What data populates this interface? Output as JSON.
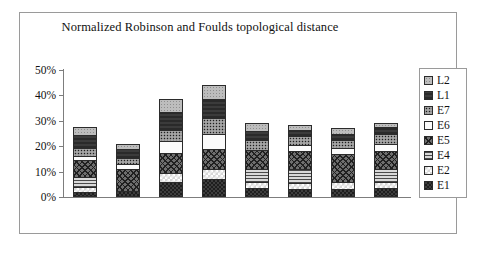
{
  "chart_data": {
    "type": "bar",
    "subtype": "stacked-column",
    "title": "Normalized Robinson and Foulds topological distance",
    "xlabel": "",
    "ylabel": "",
    "ylim": [
      0,
      50
    ],
    "ytick_labels": [
      "0%",
      "10%",
      "20%",
      "30%",
      "40%",
      "50%"
    ],
    "ytick_values": [
      0,
      10,
      20,
      30,
      40,
      50
    ],
    "grid": false,
    "legend_position": "right",
    "legend_order_top_to_bottom": [
      "L2",
      "L1",
      "E7",
      "E6",
      "E5",
      "E4",
      "E2",
      "E1"
    ],
    "stack_order_bottom_to_top": [
      "E1",
      "E2",
      "E4",
      "E5",
      "E6",
      "E7",
      "L1",
      "L2"
    ],
    "categories": [
      "E1",
      "E2",
      "E4",
      "E5",
      "E6",
      "E7",
      "L1",
      "L2"
    ],
    "series": [
      {
        "name": "E1",
        "pattern": "E1",
        "values": [
          2.0,
          2.5,
          6.0,
          7.0,
          3.5,
          3.0,
          3.0,
          3.5
        ]
      },
      {
        "name": "E2",
        "pattern": "E2",
        "values": [
          2.0,
          0.0,
          3.5,
          4.0,
          2.5,
          2.5,
          3.0,
          2.5
        ]
      },
      {
        "name": "E4",
        "pattern": "E4",
        "values": [
          4.0,
          0.0,
          0.0,
          0.0,
          5.0,
          5.5,
          0.0,
          5.0
        ]
      },
      {
        "name": "E5",
        "pattern": "E5",
        "values": [
          6.5,
          8.5,
          8.0,
          8.0,
          7.5,
          7.0,
          11.0,
          7.0
        ]
      },
      {
        "name": "E6",
        "pattern": "E6",
        "values": [
          1.5,
          2.0,
          4.5,
          6.0,
          0.0,
          2.5,
          2.5,
          3.0
        ]
      },
      {
        "name": "E7",
        "pattern": "E7",
        "values": [
          3.5,
          2.5,
          4.5,
          6.0,
          4.0,
          3.5,
          3.0,
          4.0
        ]
      },
      {
        "name": "L1",
        "pattern": "L1",
        "values": [
          5.0,
          3.5,
          7.0,
          7.5,
          3.5,
          2.5,
          2.5,
          2.5
        ]
      },
      {
        "name": "L2",
        "pattern": "L2",
        "values": [
          3.0,
          2.0,
          5.0,
          5.5,
          3.0,
          2.0,
          2.0,
          1.5
        ]
      }
    ],
    "totals": [
      27.5,
      21.0,
      38.5,
      44.0,
      29.0,
      28.5,
      27.0,
      29.0
    ]
  },
  "legend": {
    "items": [
      {
        "label": "L2"
      },
      {
        "label": "L1"
      },
      {
        "label": "E7"
      },
      {
        "label": "E6"
      },
      {
        "label": "E5"
      },
      {
        "label": "E4"
      },
      {
        "label": "E2"
      },
      {
        "label": "E1"
      }
    ]
  },
  "colors": {
    "frame_border": "#9a9a9a",
    "axis_line": "#7d7d7d",
    "segment_border": "#2b2b2b",
    "text": "#111111",
    "background": "#ffffff"
  }
}
